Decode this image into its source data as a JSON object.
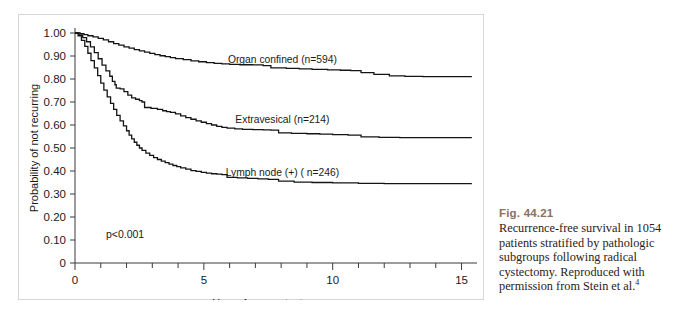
{
  "figure": {
    "caption_title": "Fig. 44.21",
    "caption_text": "Recurrence-free survival in 1054 patients stratified by pathologic subgroups following radical cystectomy. Reproduced with permission from Stein et al.",
    "caption_footnote": "4",
    "caption_title_color": "#8a7060"
  },
  "chart_data": {
    "type": "line",
    "title": "",
    "xlabel": "Years from cystectomy",
    "ylabel": "Probability of not recurring",
    "xlim": [
      0,
      15.6
    ],
    "ylim": [
      0,
      1.0
    ],
    "grid": false,
    "legend_position": "inline-right",
    "xticks": [
      0,
      1,
      2,
      3,
      4,
      5,
      6,
      7,
      8,
      9,
      10,
      11,
      12,
      13,
      14,
      15
    ],
    "xtick_labels": [
      "0",
      "",
      "",
      "",
      "",
      "5",
      "",
      "",
      "",
      "",
      "10",
      "",
      "",
      "",
      "",
      "15"
    ],
    "yticks": [
      0,
      0.1,
      0.2,
      0.3,
      0.4,
      0.5,
      0.6,
      0.7,
      0.8,
      0.9,
      1.0
    ],
    "ytick_labels": [
      "0",
      "0.10",
      "0.20",
      "0.30",
      "0.40",
      "0.50",
      "0.60",
      "0.70",
      "0.80",
      "0.90",
      "1.00"
    ],
    "annotations": [
      {
        "text": "p<0.001",
        "x": 1.2,
        "y": 0.125
      }
    ],
    "series": [
      {
        "name": "Organ confined (n=594)",
        "n": 594,
        "label_x": 8.05,
        "label_y": 0.885,
        "plateau": 0.81,
        "points": [
          [
            0.0,
            1.0
          ],
          [
            0.2,
            0.997
          ],
          [
            0.35,
            0.993
          ],
          [
            0.5,
            0.988
          ],
          [
            0.7,
            0.983
          ],
          [
            0.9,
            0.977
          ],
          [
            1.1,
            0.97
          ],
          [
            1.3,
            0.962
          ],
          [
            1.5,
            0.954
          ],
          [
            1.7,
            0.947
          ],
          [
            1.9,
            0.94
          ],
          [
            2.1,
            0.934
          ],
          [
            2.3,
            0.928
          ],
          [
            2.5,
            0.922
          ],
          [
            2.7,
            0.917
          ],
          [
            2.9,
            0.911
          ],
          [
            3.1,
            0.906
          ],
          [
            3.3,
            0.901
          ],
          [
            3.5,
            0.897
          ],
          [
            3.7,
            0.893
          ],
          [
            3.9,
            0.889
          ],
          [
            4.2,
            0.884
          ],
          [
            4.5,
            0.879
          ],
          [
            4.8,
            0.875
          ],
          [
            5.1,
            0.871
          ],
          [
            5.4,
            0.868
          ],
          [
            5.7,
            0.866
          ],
          [
            6.0,
            0.864
          ],
          [
            6.4,
            0.862
          ],
          [
            6.9,
            0.861
          ],
          [
            7.3,
            0.858
          ],
          [
            7.6,
            0.848
          ],
          [
            8.2,
            0.846
          ],
          [
            8.7,
            0.844
          ],
          [
            9.2,
            0.842
          ],
          [
            9.8,
            0.84
          ],
          [
            10.3,
            0.838
          ],
          [
            10.7,
            0.836
          ],
          [
            11.1,
            0.828
          ],
          [
            11.6,
            0.82
          ],
          [
            12.2,
            0.814
          ],
          [
            12.8,
            0.811
          ],
          [
            13.5,
            0.81
          ],
          [
            15.4,
            0.81
          ]
        ]
      },
      {
        "name": "Extravesical (n=214)",
        "n": 214,
        "label_x": 8.05,
        "label_y": 0.625,
        "plateau": 0.555,
        "points": [
          [
            0.0,
            1.0
          ],
          [
            0.15,
            0.992
          ],
          [
            0.3,
            0.98
          ],
          [
            0.45,
            0.962
          ],
          [
            0.6,
            0.94
          ],
          [
            0.75,
            0.915
          ],
          [
            0.9,
            0.888
          ],
          [
            1.05,
            0.86
          ],
          [
            1.2,
            0.835
          ],
          [
            1.35,
            0.812
          ],
          [
            1.45,
            0.79
          ],
          [
            1.55,
            0.775
          ],
          [
            1.6,
            0.76
          ],
          [
            1.75,
            0.757
          ],
          [
            1.9,
            0.745
          ],
          [
            2.05,
            0.73
          ],
          [
            2.2,
            0.718
          ],
          [
            2.35,
            0.712
          ],
          [
            2.5,
            0.706
          ],
          [
            2.6,
            0.7
          ],
          [
            2.7,
            0.676
          ],
          [
            2.95,
            0.672
          ],
          [
            3.2,
            0.668
          ],
          [
            3.4,
            0.662
          ],
          [
            3.55,
            0.658
          ],
          [
            3.7,
            0.655
          ],
          [
            3.9,
            0.648
          ],
          [
            4.1,
            0.64
          ],
          [
            4.3,
            0.632
          ],
          [
            4.5,
            0.625
          ],
          [
            4.7,
            0.618
          ],
          [
            4.9,
            0.612
          ],
          [
            5.1,
            0.606
          ],
          [
            5.3,
            0.6
          ],
          [
            5.5,
            0.594
          ],
          [
            5.7,
            0.59
          ],
          [
            5.9,
            0.586
          ],
          [
            6.2,
            0.583
          ],
          [
            6.5,
            0.581
          ],
          [
            6.9,
            0.58
          ],
          [
            7.3,
            0.579
          ],
          [
            7.6,
            0.578
          ],
          [
            7.9,
            0.566
          ],
          [
            8.4,
            0.564
          ],
          [
            9.0,
            0.562
          ],
          [
            9.5,
            0.56
          ],
          [
            10.0,
            0.558
          ],
          [
            10.6,
            0.556
          ],
          [
            11.1,
            0.548
          ],
          [
            11.8,
            0.546
          ],
          [
            12.6,
            0.545
          ],
          [
            15.4,
            0.545
          ]
        ]
      },
      {
        "name": "Lymph node (+) (  n=246)",
        "n": 246,
        "label_x": 8.05,
        "label_y": 0.395,
        "plateau": 0.345,
        "points": [
          [
            0.0,
            1.0
          ],
          [
            0.12,
            0.988
          ],
          [
            0.25,
            0.968
          ],
          [
            0.38,
            0.942
          ],
          [
            0.5,
            0.912
          ],
          [
            0.62,
            0.88
          ],
          [
            0.75,
            0.848
          ],
          [
            0.88,
            0.815
          ],
          [
            1.0,
            0.782
          ],
          [
            1.12,
            0.752
          ],
          [
            1.25,
            0.722
          ],
          [
            1.38,
            0.694
          ],
          [
            1.5,
            0.668
          ],
          [
            1.62,
            0.642
          ],
          [
            1.75,
            0.618
          ],
          [
            1.88,
            0.596
          ],
          [
            2.0,
            0.575
          ],
          [
            2.1,
            0.556
          ],
          [
            2.2,
            0.54
          ],
          [
            2.3,
            0.525
          ],
          [
            2.4,
            0.512
          ],
          [
            2.5,
            0.5
          ],
          [
            2.6,
            0.49
          ],
          [
            2.75,
            0.478
          ],
          [
            2.9,
            0.468
          ],
          [
            3.05,
            0.458
          ],
          [
            3.2,
            0.45
          ],
          [
            3.35,
            0.443
          ],
          [
            3.5,
            0.436
          ],
          [
            3.65,
            0.43
          ],
          [
            3.8,
            0.424
          ],
          [
            3.95,
            0.419
          ],
          [
            4.1,
            0.414
          ],
          [
            4.3,
            0.408
          ],
          [
            4.5,
            0.402
          ],
          [
            4.7,
            0.398
          ],
          [
            4.9,
            0.394
          ],
          [
            5.1,
            0.391
          ],
          [
            5.3,
            0.388
          ],
          [
            5.5,
            0.386
          ],
          [
            5.7,
            0.384
          ],
          [
            5.9,
            0.372
          ],
          [
            6.3,
            0.37
          ],
          [
            6.7,
            0.368
          ],
          [
            7.1,
            0.366
          ],
          [
            7.5,
            0.364
          ],
          [
            7.9,
            0.356
          ],
          [
            8.5,
            0.352
          ],
          [
            9.2,
            0.35
          ],
          [
            10.0,
            0.348
          ],
          [
            11.0,
            0.346
          ],
          [
            12.0,
            0.345
          ],
          [
            13.0,
            0.345
          ],
          [
            15.4,
            0.345
          ]
        ]
      }
    ]
  }
}
